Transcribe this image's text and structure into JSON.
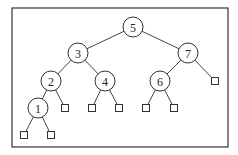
{
  "diagram": {
    "type": "binary-search-tree",
    "frame": {
      "x": 12,
      "y": 8,
      "w": 216,
      "h": 139
    },
    "nodes": [
      {
        "id": "n5",
        "label": "5",
        "x": 133,
        "y": 27
      },
      {
        "id": "n3",
        "label": "3",
        "x": 78,
        "y": 53
      },
      {
        "id": "n7",
        "label": "7",
        "x": 188,
        "y": 53
      },
      {
        "id": "n2",
        "label": "2",
        "x": 51,
        "y": 81
      },
      {
        "id": "n4",
        "label": "4",
        "x": 105,
        "y": 81
      },
      {
        "id": "n6",
        "label": "6",
        "x": 160,
        "y": 81
      },
      {
        "id": "n1",
        "label": "1",
        "x": 38,
        "y": 108
      }
    ],
    "leaves": [
      {
        "id": "l7r",
        "x": 215,
        "y": 81
      },
      {
        "id": "l2r",
        "x": 65,
        "y": 108
      },
      {
        "id": "l4l",
        "x": 92,
        "y": 108
      },
      {
        "id": "l4r",
        "x": 119,
        "y": 108
      },
      {
        "id": "l6l",
        "x": 146,
        "y": 108
      },
      {
        "id": "l6r",
        "x": 174,
        "y": 108
      },
      {
        "id": "l1l",
        "x": 24,
        "y": 135
      },
      {
        "id": "l1r",
        "x": 51,
        "y": 135
      }
    ],
    "edges": [
      [
        "n5",
        "n3"
      ],
      [
        "n5",
        "n7"
      ],
      [
        "n3",
        "n2"
      ],
      [
        "n3",
        "n4"
      ],
      [
        "n7",
        "n6"
      ],
      [
        "n7",
        "l7r"
      ],
      [
        "n2",
        "n1"
      ],
      [
        "n2",
        "l2r"
      ],
      [
        "n4",
        "l4l"
      ],
      [
        "n4",
        "l4r"
      ],
      [
        "n6",
        "l6l"
      ],
      [
        "n6",
        "l6r"
      ],
      [
        "n1",
        "l1l"
      ],
      [
        "n1",
        "l1r"
      ]
    ]
  }
}
